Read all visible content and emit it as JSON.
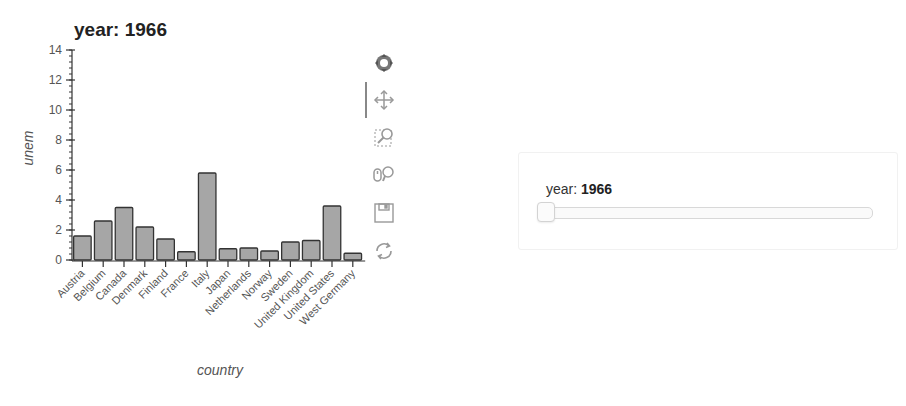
{
  "chart_data": {
    "type": "bar",
    "title": "year: 1966",
    "xlabel": "country",
    "ylabel": "unem",
    "categories": [
      "Austria",
      "Belgium",
      "Canada",
      "Denmark",
      "Finland",
      "France",
      "Italy",
      "Japan",
      "Netherlands",
      "Norway",
      "Sweden",
      "United Kingdom",
      "United States",
      "West Germany"
    ],
    "values": [
      1.6,
      2.6,
      3.5,
      2.2,
      1.4,
      0.55,
      5.8,
      0.75,
      0.8,
      0.6,
      1.2,
      1.3,
      3.6,
      0.45
    ],
    "ylim": [
      0,
      14
    ],
    "yticks": [
      0,
      2,
      4,
      6,
      8,
      10,
      12,
      14
    ],
    "grid": false,
    "legend": null,
    "bar_color": "#a6a6a6",
    "bar_edge_color": "#333333"
  },
  "toolbar": {
    "tools": [
      {
        "name": "bokeh-logo-icon",
        "label": "Bokeh"
      },
      {
        "name": "pan-icon",
        "label": "Pan",
        "active": true
      },
      {
        "name": "box-zoom-icon",
        "label": "Box Zoom"
      },
      {
        "name": "wheel-zoom-icon",
        "label": "Wheel Zoom"
      },
      {
        "name": "save-icon",
        "label": "Save"
      },
      {
        "name": "reset-icon",
        "label": "Reset"
      }
    ]
  },
  "slider": {
    "label": "year: ",
    "value": "1966"
  }
}
